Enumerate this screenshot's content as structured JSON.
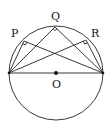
{
  "diagram": {
    "type": "geometry",
    "labels": {
      "P": "P",
      "Q": "Q",
      "R": "R",
      "O": "O"
    },
    "colors": {
      "stroke": "#222222",
      "background": "#ffffff"
    }
  }
}
